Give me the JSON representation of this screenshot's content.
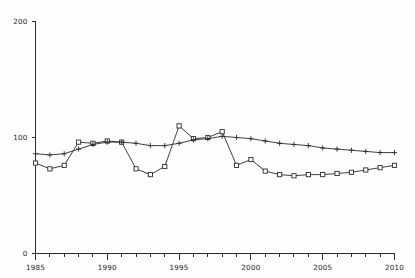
{
  "chart_data": {
    "type": "line",
    "title": "",
    "subtitle": "",
    "xlabel": "",
    "ylabel": "",
    "xlim": [
      1985,
      2010
    ],
    "ylim": [
      0,
      200
    ],
    "grid": false,
    "legend": "none",
    "y_ticks": [
      0,
      100,
      200
    ],
    "y_tick_labels": [
      "0",
      "100",
      "200"
    ],
    "x_ticks": [
      1985,
      1986,
      1987,
      1988,
      1989,
      1990,
      1991,
      1992,
      1993,
      1994,
      1995,
      1996,
      1997,
      1998,
      1999,
      2000,
      2001,
      2002,
      2003,
      2004,
      2005,
      2006,
      2007,
      2008,
      2009,
      2010
    ],
    "x_tick_labels_major": [
      "1985",
      "1990",
      "1995",
      "2000",
      "2005",
      "2010"
    ],
    "x_major_ticks": [
      1985,
      1990,
      1995,
      2000,
      2005,
      2010
    ],
    "x": [
      1985,
      1986,
      1987,
      1988,
      1989,
      1990,
      1991,
      1992,
      1993,
      1994,
      1995,
      1996,
      1997,
      1998,
      1999,
      2000,
      2001,
      2002,
      2003,
      2004,
      2005,
      2006,
      2007,
      2008,
      2009,
      2010
    ],
    "series": [
      {
        "name": "square-series",
        "marker": "square",
        "values": [
          78,
          73,
          76,
          96,
          95,
          97,
          96,
          73,
          68,
          75,
          110,
          99,
          100,
          105,
          76,
          81,
          71,
          68,
          67,
          68,
          68,
          69,
          70,
          72,
          74,
          76
        ]
      },
      {
        "name": "plus-series",
        "marker": "plus",
        "values": [
          86,
          85,
          86,
          90,
          94,
          96,
          96,
          95,
          93,
          93,
          95,
          98,
          99,
          101,
          100,
          99,
          97,
          95,
          94,
          93,
          91,
          90,
          89,
          88,
          87,
          87
        ]
      }
    ]
  },
  "axes": {
    "y_axis_name": "y-axis",
    "x_axis_name": "x-axis"
  },
  "colors": {
    "ink": "#2b2b2b",
    "background": "#fdfdfd",
    "marker_fill": "#ffffff"
  }
}
